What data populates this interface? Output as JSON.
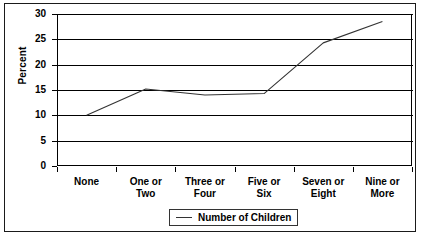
{
  "chart_data": {
    "type": "line",
    "title": "",
    "xlabel": "",
    "ylabel": "Percent",
    "categories": [
      "None",
      "One or Two",
      "Three or Four",
      "Five or Six",
      "Seven or Eight",
      "Nine or More"
    ],
    "category_lines": [
      [
        "None"
      ],
      [
        "One or",
        "Two"
      ],
      [
        "Three or",
        "Four"
      ],
      [
        "Five or",
        "Six"
      ],
      [
        "Seven or",
        "Eight"
      ],
      [
        "Nine or",
        "More"
      ]
    ],
    "series": [
      {
        "name": "Number of Children",
        "values": [
          10.0,
          15.2,
          14.0,
          14.3,
          24.3,
          28.5
        ]
      }
    ],
    "ylim": [
      0,
      30
    ],
    "yticks": [
      0,
      5,
      10,
      15,
      20,
      25,
      30
    ],
    "ytick_labels": [
      "0",
      "5",
      "10",
      "15",
      "20",
      "25",
      "30"
    ],
    "grid": true,
    "legend_position": "bottom",
    "line_color": "#333333",
    "axis_color": "#000000",
    "background_color": "#ffffff"
  },
  "legend": {
    "entries": [
      {
        "label": "Number of Children",
        "color": "#333333"
      }
    ]
  }
}
